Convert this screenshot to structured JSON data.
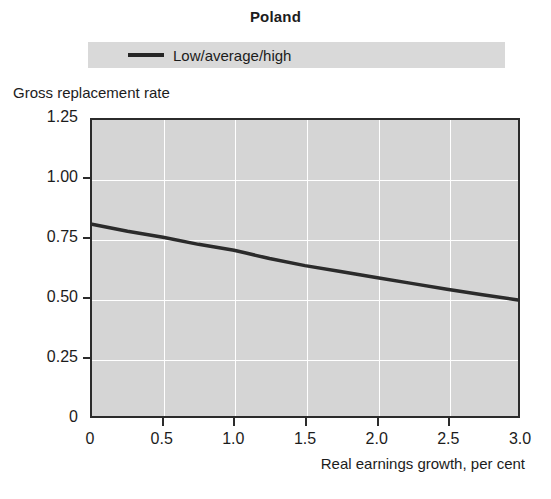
{
  "chart_data": {
    "type": "line",
    "title": "Poland",
    "xlabel": "Real earnings growth, per cent",
    "ylabel": "Gross replacement rate",
    "xlim": [
      0,
      3.0
    ],
    "ylim": [
      0,
      1.25
    ],
    "grid": true,
    "legend_position": "top",
    "legend": [
      "Low/average/high"
    ],
    "x_ticks": [
      "0",
      "0.5",
      "1.0",
      "1.5",
      "2.0",
      "2.5",
      "3.0"
    ],
    "x_tick_values": [
      0,
      0.5,
      1.0,
      1.5,
      2.0,
      2.5,
      3.0
    ],
    "y_ticks": [
      "0",
      "0.25",
      "0.50",
      "0.75",
      "1.00",
      "1.25"
    ],
    "y_tick_values": [
      0,
      0.25,
      0.5,
      0.75,
      1.0,
      1.25
    ],
    "series": [
      {
        "name": "Low/average/high",
        "color": "#2b2b2b",
        "x": [
          0,
          0.25,
          0.5,
          0.75,
          1.0,
          1.25,
          1.5,
          1.75,
          2.0,
          2.25,
          2.5,
          2.75,
          3.0
        ],
        "values": [
          0.81,
          0.78,
          0.755,
          0.725,
          0.7,
          0.665,
          0.635,
          0.61,
          0.585,
          0.56,
          0.535,
          0.512,
          0.49
        ]
      }
    ]
  },
  "chart": {
    "title": "Poland",
    "y_axis_title": "Gross replacement rate",
    "x_axis_title": "Real earnings growth, per cent",
    "legend": {
      "label": "Low/average/high"
    },
    "y_tick_labels": [
      "1.25",
      "1.00",
      "0.75",
      "0.50",
      "0.25",
      "0"
    ],
    "x_tick_labels": [
      "0",
      "0.5",
      "1.0",
      "1.5",
      "2.0",
      "2.5",
      "3.0"
    ]
  },
  "colors": {
    "plot_background": "#d5d5d5",
    "legend_background": "#d9d9d9",
    "line": "#2b2b2b",
    "grid": "#ffffff",
    "axis": "#2b2b2b",
    "text": "#1c1c1c"
  }
}
